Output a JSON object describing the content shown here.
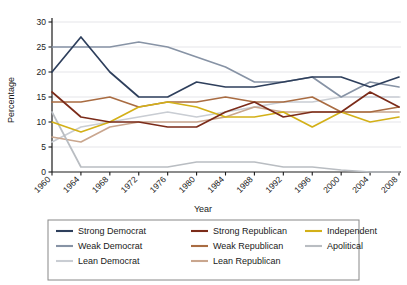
{
  "chart_data": {
    "type": "line",
    "title": "",
    "xlabel": "Year",
    "ylabel": "Percentage",
    "categories": [
      1960,
      1964,
      1968,
      1972,
      1976,
      1980,
      1984,
      1988,
      1992,
      1996,
      2000,
      2004,
      2008
    ],
    "x": [
      1960,
      1964,
      1968,
      1972,
      1976,
      1980,
      1984,
      1988,
      1992,
      1996,
      2000,
      2004,
      2008
    ],
    "xlim": [
      1960,
      2008
    ],
    "ylim": [
      0,
      30
    ],
    "yticks": [
      0,
      5,
      10,
      15,
      20,
      25,
      30
    ],
    "xticks": [
      "1960",
      "1964",
      "1968",
      "1972",
      "1976",
      "1980",
      "1984",
      "1988",
      "1992",
      "1996",
      "2000",
      "2004",
      "2008"
    ],
    "grid": true,
    "grid_axis": "y",
    "legend_position": "bottom",
    "legend_columns": 3,
    "series": [
      {
        "name": "Strong Democrat",
        "color": "#2e3f5c",
        "values": [
          20,
          27,
          20,
          15,
          15,
          18,
          17,
          17,
          18,
          19,
          19,
          17,
          19
        ]
      },
      {
        "name": "Weak Democrat",
        "color": "#8793a5",
        "values": [
          25,
          25,
          25,
          26,
          25,
          23,
          21,
          18,
          18,
          19,
          15,
          18,
          17
        ]
      },
      {
        "name": "Lean Democrat",
        "color": "#c9cdd3",
        "values": [
          6,
          9,
          10,
          11,
          12,
          11,
          12,
          13,
          14,
          14,
          15,
          15,
          15
        ]
      },
      {
        "name": "Strong Republican",
        "color": "#7b2b19",
        "values": [
          16,
          11,
          10,
          10,
          9,
          9,
          12,
          14,
          11,
          12,
          12,
          16,
          13
        ]
      },
      {
        "name": "Weak Republican",
        "color": "#a96c42",
        "values": [
          14,
          14,
          15,
          13,
          14,
          14,
          15,
          14,
          14,
          15,
          12,
          12,
          13
        ]
      },
      {
        "name": "Lean Republican",
        "color": "#c9a68e",
        "values": [
          7,
          6,
          9,
          10,
          10,
          10,
          11,
          13,
          12,
          12,
          12,
          12,
          12
        ]
      },
      {
        "name": "Independent",
        "color": "#d3b018",
        "values": [
          10,
          8,
          10,
          13,
          14,
          13,
          11,
          11,
          12,
          9,
          12,
          10,
          11
        ]
      },
      {
        "name": "Apolitical",
        "color": "#b9bdc2",
        "values": [
          12,
          1,
          1,
          1,
          1,
          2,
          2,
          2,
          1,
          1,
          0.4,
          0,
          0
        ]
      }
    ]
  },
  "legend": {
    "items": [
      {
        "label": "Strong Democrat",
        "color": "#2e3f5c"
      },
      {
        "label": "Weak Democrat",
        "color": "#8793a5"
      },
      {
        "label": "Lean Democrat",
        "color": "#c9cdd3"
      },
      {
        "label": "Strong Republican",
        "color": "#7b2b19"
      },
      {
        "label": "Weak Republican",
        "color": "#a96c42"
      },
      {
        "label": "Lean Republican",
        "color": "#c9a68e"
      },
      {
        "label": "Independent",
        "color": "#d3b018"
      },
      {
        "label": "Apolitical",
        "color": "#b9bdc2"
      }
    ]
  },
  "axes": {
    "y_title": "Percentage",
    "x_title": "Year"
  },
  "style": {
    "axis_color": "#1a1a1a",
    "grid_color": "#e2e2e6",
    "legend_border": "#888888",
    "background": "#ffffff"
  }
}
